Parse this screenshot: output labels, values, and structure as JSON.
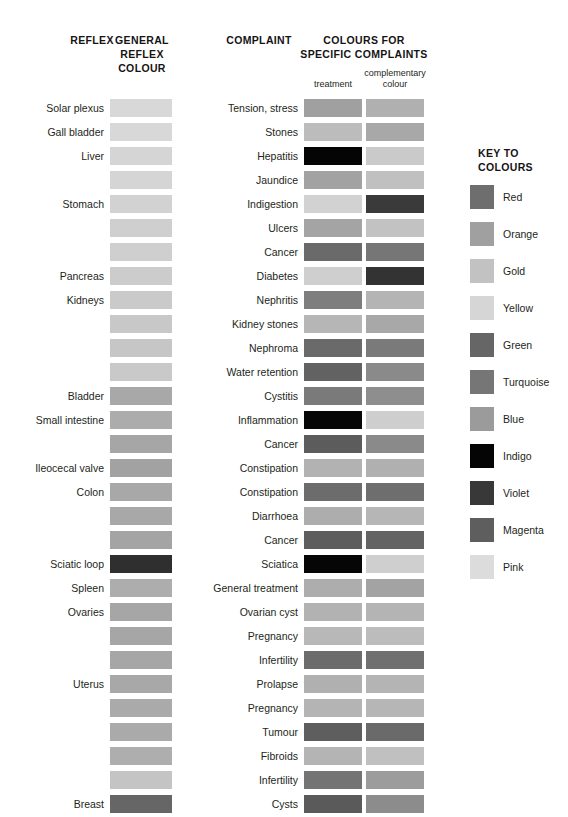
{
  "headers": {
    "reflex": "REFLEX",
    "general_reflex_colour": "GENERAL\nREFLEX\nCOLOUR",
    "complaint": "COMPLAINT",
    "colours_for_specific_complaints": "COLOURS FOR\nSPECIFIC COMPLAINTS",
    "treatment": "treatment",
    "complementary_colour": "complementary\ncolour",
    "key_to_colours": "KEY TO\nCOLOURS"
  },
  "palette": {
    "Red": "#6e6e6e",
    "Orange": "#a0a0a0",
    "Gold": "#c2c2c2",
    "Yellow": "#d6d6d6",
    "Green": "#666666",
    "Turquoise": "#767676",
    "Blue": "#9b9b9b",
    "Indigo": "#050505",
    "Violet": "#383838",
    "Magenta": "#5e5e5e",
    "Pink": "#dcdcdc"
  },
  "legend": {
    "title": "KEY TO COLOURS",
    "items": [
      {
        "name": "Red",
        "swatch": "#6e6e6e"
      },
      {
        "name": "Orange",
        "swatch": "#a0a0a0"
      },
      {
        "name": "Gold",
        "swatch": "#c2c2c2"
      },
      {
        "name": "Yellow",
        "swatch": "#d6d6d6"
      },
      {
        "name": "Green",
        "swatch": "#666666"
      },
      {
        "name": "Turquoise",
        "swatch": "#767676"
      },
      {
        "name": "Blue",
        "swatch": "#9b9b9b"
      },
      {
        "name": "Indigo",
        "swatch": "#050505"
      },
      {
        "name": "Violet",
        "swatch": "#383838"
      },
      {
        "name": "Magenta",
        "swatch": "#5e5e5e"
      },
      {
        "name": "Pink",
        "swatch": "#dcdcdc"
      }
    ]
  },
  "rows": [
    {
      "reflex": "Solar plexus",
      "general": "#d8d8d8",
      "complaint": "Tension, stress",
      "treatment": "#a0a0a0",
      "complementary": "#b0b0b0"
    },
    {
      "reflex": "Gall bladder",
      "general": "#d8d8d8",
      "complaint": "Stones",
      "treatment": "#bcbcbc",
      "complementary": "#a8a8a8"
    },
    {
      "reflex": "Liver",
      "general": "#d5d5d5",
      "complaint": "Hepatitis",
      "treatment": "#050505",
      "complementary": "#cacaca"
    },
    {
      "reflex": "",
      "general": "#d5d5d5",
      "complaint": "Jaundice",
      "treatment": "#a2a2a2",
      "complementary": "#c0c0c0"
    },
    {
      "reflex": "Stomach",
      "general": "#d2d2d2",
      "complaint": "Indigestion",
      "treatment": "#d2d2d2",
      "complementary": "#3a3a3a"
    },
    {
      "reflex": "",
      "general": "#cfcfcf",
      "complaint": "Ulcers",
      "treatment": "#a4a4a4",
      "complementary": "#c2c2c2"
    },
    {
      "reflex": "",
      "general": "#cfcfcf",
      "complaint": "Cancer",
      "treatment": "#6a6a6a",
      "complementary": "#767676"
    },
    {
      "reflex": "Pancreas",
      "general": "#cccccc",
      "complaint": "Diabetes",
      "treatment": "#cfcfcf",
      "complementary": "#333333"
    },
    {
      "reflex": "Kidneys",
      "general": "#cacaca",
      "complaint": "Nephritis",
      "treatment": "#7e7e7e",
      "complementary": "#b4b4b4"
    },
    {
      "reflex": "",
      "general": "#c8c8c8",
      "complaint": "Kidney stones",
      "treatment": "#b6b6b6",
      "complementary": "#a8a8a8"
    },
    {
      "reflex": "",
      "general": "#c6c6c6",
      "complaint": "Nephroma",
      "treatment": "#6a6a6a",
      "complementary": "#7a7a7a"
    },
    {
      "reflex": "",
      "general": "#c9c9c9",
      "complaint": "Water retention",
      "treatment": "#626262",
      "complementary": "#8a8a8a"
    },
    {
      "reflex": "Bladder",
      "general": "#a8a8a8",
      "complaint": "Cystitis",
      "treatment": "#7a7a7a",
      "complementary": "#8e8e8e"
    },
    {
      "reflex": "Small intestine",
      "general": "#acacac",
      "complaint": "Inflammation",
      "treatment": "#070707",
      "complementary": "#cecece"
    },
    {
      "reflex": "",
      "general": "#a6a6a6",
      "complaint": "Cancer",
      "treatment": "#5c5c5c",
      "complementary": "#8a8a8a"
    },
    {
      "reflex": "Ileocecal valve",
      "general": "#a2a2a2",
      "complaint": "Constipation",
      "treatment": "#b2b2b2",
      "complementary": "#b0b0b0"
    },
    {
      "reflex": "Colon",
      "general": "#a8a8a8",
      "complaint": "Constipation",
      "treatment": "#6c6c6c",
      "complementary": "#6e6e6e"
    },
    {
      "reflex": "",
      "general": "#a8a8a8",
      "complaint": "Diarrhoea",
      "treatment": "#adadad",
      "complementary": "#b6b6b6"
    },
    {
      "reflex": "",
      "general": "#a4a4a4",
      "complaint": "Cancer",
      "treatment": "#5e5e5e",
      "complementary": "#646464"
    },
    {
      "reflex": "Sciatic loop",
      "general": "#2f2f2f",
      "complaint": "Sciatica",
      "treatment": "#060606",
      "complementary": "#cfcfcf"
    },
    {
      "reflex": "Spleen",
      "general": "#adadad",
      "complaint": "General treatment",
      "treatment": "#adadad",
      "complementary": "#a3a3a3"
    },
    {
      "reflex": "Ovaries",
      "general": "#a6a6a6",
      "complaint": "Ovarian cyst",
      "treatment": "#b2b2b2",
      "complementary": "#b4b4b4"
    },
    {
      "reflex": "",
      "general": "#a6a6a6",
      "complaint": "Pregnancy",
      "treatment": "#b8b8b8",
      "complementary": "#bcbcbc"
    },
    {
      "reflex": "",
      "general": "#a6a6a6",
      "complaint": "Infertility",
      "treatment": "#6c6c6c",
      "complementary": "#707070"
    },
    {
      "reflex": "Uterus",
      "general": "#a8a8a8",
      "complaint": "Prolapse",
      "treatment": "#b0b0b0",
      "complementary": "#b4b4b4"
    },
    {
      "reflex": "",
      "general": "#aaaaaa",
      "complaint": "Pregnancy",
      "treatment": "#b4b4b4",
      "complementary": "#b6b6b6"
    },
    {
      "reflex": "",
      "general": "#aaaaaa",
      "complaint": "Tumour",
      "treatment": "#5e5e5e",
      "complementary": "#6a6a6a"
    },
    {
      "reflex": "",
      "general": "#aeaeae",
      "complaint": "Fibroids",
      "treatment": "#b4b4b4",
      "complementary": "#c0c0c0"
    },
    {
      "reflex": "",
      "general": "#c4c4c4",
      "complaint": "Infertility",
      "treatment": "#747474",
      "complementary": "#9c9c9c"
    },
    {
      "reflex": "Breast",
      "general": "#666666",
      "complaint": "Cysts",
      "treatment": "#5a5a5a",
      "complementary": "#8c8c8c"
    },
    {
      "reflex": "",
      "general": "#5e5e5e",
      "complaint": "Cancer",
      "treatment": "#5c5c5c",
      "complementary": "#777777"
    },
    {
      "reflex": "",
      "general": "#5e5e5e",
      "complaint": "Mastitis",
      "treatment": "#b4b4b4",
      "complementary": "#c6c6c6"
    },
    {
      "reflex": "Lymphatic system",
      "general": "#6a6a6a",
      "complaint": "General treatment",
      "treatment": "#747474",
      "complementary": "#8e8e8e"
    },
    {
      "reflex": "Sacro-iliac joint",
      "general": "#d8d8d8",
      "complaint": "Arthritis",
      "treatment": "#d5d5d5",
      "complementary": "#3a3a3a"
    },
    {
      "reflex": "Prostate",
      "general": "#c0c0c0",
      "complaint": "Enlarged",
      "treatment": "#acacac",
      "complementary": "#c2c2c2"
    },
    {
      "reflex": "Testes",
      "general": "#6e6e6e",
      "complaint": "Malignant tumour",
      "treatment": "#5c5c5c",
      "complementary": "#7a7a7a"
    },
    {
      "reflex": "Anus",
      "general": "#6e6e6e",
      "complaint": "Piles",
      "treatment": "#d2d2d2",
      "complementary": "#3a3a3a"
    }
  ]
}
